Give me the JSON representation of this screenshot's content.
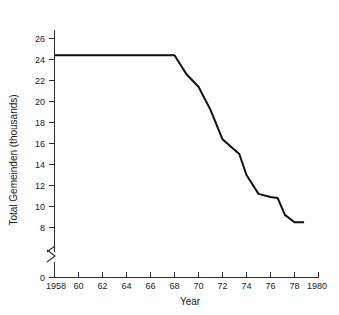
{
  "chart_data": {
    "type": "line",
    "title": "",
    "xlabel": "Year",
    "ylabel": "Total Gemeinden (thousands)",
    "xlim": [
      1958,
      1980
    ],
    "ylim": [
      8,
      27
    ],
    "y_axis_break": true,
    "y_break_between": [
      0,
      8
    ],
    "grid": false,
    "legend": null,
    "x_ticks": [
      1958,
      1960,
      1962,
      1964,
      1966,
      1968,
      1970,
      1972,
      1974,
      1976,
      1978,
      1980
    ],
    "x_tick_labels": [
      "1958",
      "60",
      "62",
      "64",
      "66",
      "68",
      "70",
      "72",
      "74",
      "76",
      "78",
      "1980"
    ],
    "y_ticks": [
      0,
      8,
      10,
      12,
      14,
      16,
      18,
      20,
      22,
      24,
      26
    ],
    "y_tick_labels": [
      "0",
      "8",
      "10",
      "12",
      "14",
      "16",
      "18",
      "20",
      "22",
      "24",
      "26"
    ],
    "series": [
      {
        "name": "Total Gemeinden",
        "x": [
          1958,
          1968,
          1969,
          1970,
          1971,
          1972,
          1972.8,
          1973.4,
          1974,
          1975,
          1976,
          1976.6,
          1977.2,
          1978,
          1978.8
        ],
        "values": [
          24.4,
          24.4,
          22.6,
          21.4,
          19.2,
          16.4,
          15.6,
          15.0,
          13.0,
          11.2,
          10.9,
          10.8,
          9.2,
          8.5,
          8.5
        ]
      }
    ]
  }
}
